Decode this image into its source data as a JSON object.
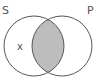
{
  "diagram": {
    "type": "venn",
    "sets": [
      {
        "name": "S",
        "label": "S"
      },
      {
        "name": "P",
        "label": "P"
      }
    ],
    "shaded_region": "S∩P",
    "shade_color": "#bdbdbd",
    "stroke_color": "#555555",
    "marks": [
      {
        "region": "S-only",
        "label": "x"
      }
    ]
  }
}
